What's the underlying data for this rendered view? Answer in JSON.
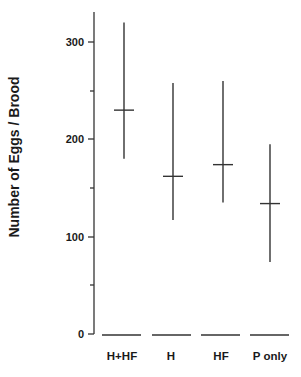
{
  "chart_data": {
    "type": "range",
    "title": "",
    "xlabel": "",
    "ylabel": "Number of Eggs / Brood",
    "ylim": [
      0,
      300
    ],
    "yticks_major": [
      0,
      100,
      200,
      300
    ],
    "yticks_minor": [
      50,
      150,
      250
    ],
    "grid": false,
    "legend": null,
    "categories": [
      "H+HF",
      "H",
      "HF",
      "P only"
    ],
    "series": [
      {
        "name": "mean",
        "values": [
          230,
          162,
          174,
          134
        ]
      },
      {
        "name": "max",
        "values": [
          320,
          258,
          260,
          195
        ]
      },
      {
        "name": "min",
        "values": [
          180,
          117,
          135,
          74
        ]
      }
    ],
    "annotations": []
  },
  "axis": {
    "y_title": "Number of Eggs / Brood",
    "tick_labels": [
      "0",
      "100",
      "200",
      "300"
    ]
  },
  "categories": {
    "labels": [
      "H+HF",
      "H",
      "HF",
      "P only"
    ]
  }
}
